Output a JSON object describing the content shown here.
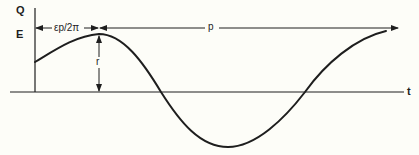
{
  "diagram": {
    "type": "sinusoid-parameter-diagram",
    "axes": {
      "y_label": "Q",
      "x_label": "t",
      "level_label": "E"
    },
    "dimensions": {
      "phase_offset_label": "εp/2π",
      "period_label": "p",
      "amplitude_label": "r"
    },
    "colors": {
      "background": "#fdfdf8",
      "ink": "#1e1e1e"
    }
  }
}
